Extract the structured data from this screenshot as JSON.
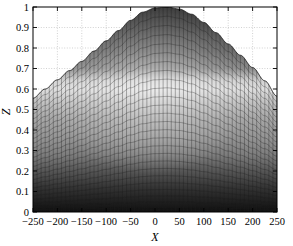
{
  "figure": {
    "background_color": "#ffffff",
    "axes_color": "#000000",
    "grid_color": "#bfbfbf",
    "mesh_line_color": "#2b2b2b"
  },
  "chart_data": {
    "type": "area",
    "title": "",
    "subtitle": "",
    "xlabel": "X",
    "ylabel": "Z",
    "xlim": [
      -250,
      250
    ],
    "ylim": [
      0,
      1
    ],
    "grid": true,
    "legend": null,
    "x_ticks": [
      -250,
      -200,
      -150,
      -100,
      -50,
      0,
      50,
      100,
      150,
      200,
      250
    ],
    "x_tick_labels": [
      "−250",
      "−200",
      "−150",
      "−100",
      "−50",
      "0",
      "50",
      "100",
      "150",
      "200",
      "250"
    ],
    "y_ticks": [
      0,
      0.1,
      0.2,
      0.3,
      0.4,
      0.5,
      0.6,
      0.7,
      0.8,
      0.9,
      1
    ],
    "y_tick_labels": [
      "0",
      "0.1",
      "0.2",
      "0.3",
      "0.4",
      "0.5",
      "0.6",
      "0.7",
      "0.8",
      "0.9",
      "1"
    ],
    "x": [
      -250,
      -225,
      -200,
      -175,
      -150,
      -125,
      -100,
      -75,
      -50,
      -25,
      0,
      25,
      50,
      75,
      100,
      125,
      150,
      175,
      200,
      225,
      250
    ],
    "series": [
      {
        "name": "surface-envelope",
        "values": [
          0.555,
          0.6,
          0.645,
          0.69,
          0.735,
          0.785,
          0.835,
          0.885,
          0.935,
          0.975,
          0.995,
          1.0,
          0.99,
          0.965,
          0.925,
          0.875,
          0.82,
          0.765,
          0.705,
          0.64,
          0.565
        ]
      }
    ],
    "shading": {
      "highlight_band": [
        0.6,
        0.72
      ],
      "highlight_center_x": 0,
      "darkest_zone": [
        0.0,
        0.22
      ],
      "top_shade": "#3a3a3a",
      "mid_shade": "#8e8e8e",
      "highlight_shade": "#dedede",
      "base_shade": "#141414"
    },
    "mesh": {
      "columns": 60,
      "rows": 26
    }
  }
}
